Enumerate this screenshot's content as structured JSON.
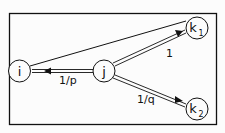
{
  "nodes": {
    "i": {
      "label": "i"
    },
    "j": {
      "label": "j"
    },
    "k1": {
      "label": "k",
      "sub": "1"
    },
    "k2": {
      "label": "k",
      "sub": "2"
    }
  },
  "edges": {
    "j_i": {
      "label": "1/p"
    },
    "j_k1": {
      "label": "1"
    },
    "j_k2": {
      "label": "1/q"
    }
  },
  "colors": {
    "stroke": "#111111",
    "background": "#fcfcfc"
  }
}
